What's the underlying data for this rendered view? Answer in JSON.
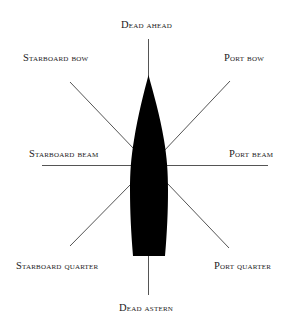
{
  "diagram": {
    "colors": {
      "hull": "#000000",
      "lines": "#555555",
      "text": "#1a1a1a",
      "background": "#ffffff"
    },
    "labels": {
      "dead_ahead": "Dead ahead",
      "starboard_bow": "Starboard bow",
      "port_bow": "Port bow",
      "starboard_beam": "Starboard beam",
      "port_beam": "Port beam",
      "starboard_quarter": "Starboard quarter",
      "port_quarter": "Port quarter",
      "dead_astern": "Dead astern"
    }
  }
}
